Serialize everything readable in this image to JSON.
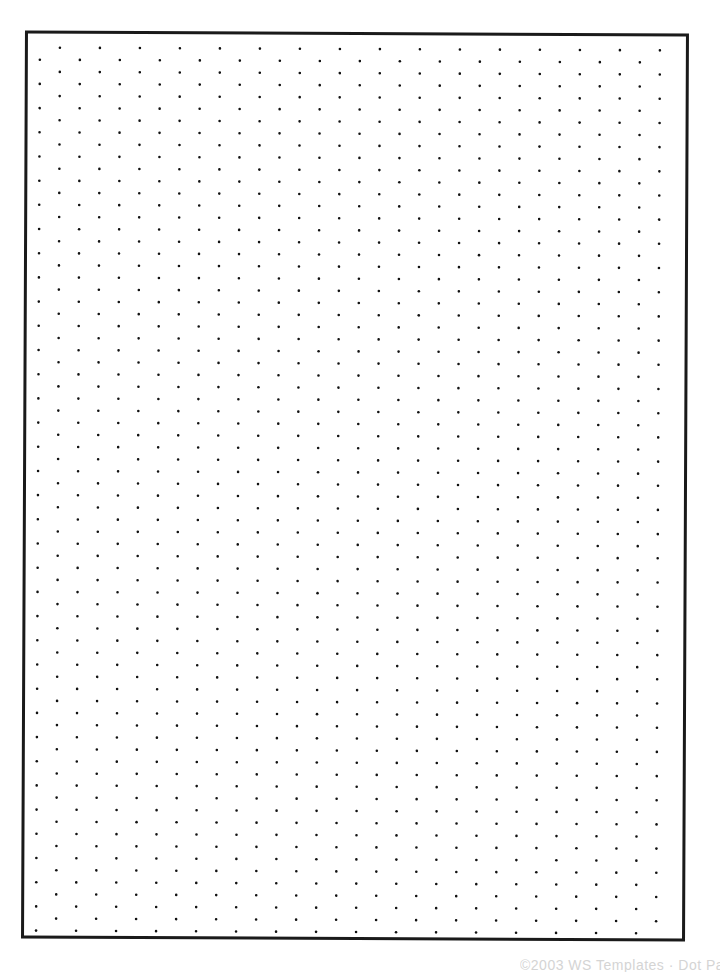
{
  "document": {
    "type": "isometric-dot-grid-paper",
    "border_color": "#1a1a1a",
    "dot_color": "#111111",
    "grid": {
      "horizontal_spacing_px": 40,
      "row_spacing_px": 12,
      "row_offset_px": 20,
      "rows": 74,
      "dots_per_row": 16
    },
    "footer": {
      "text": "©2003 WS Templates · Dot Paper"
    }
  }
}
